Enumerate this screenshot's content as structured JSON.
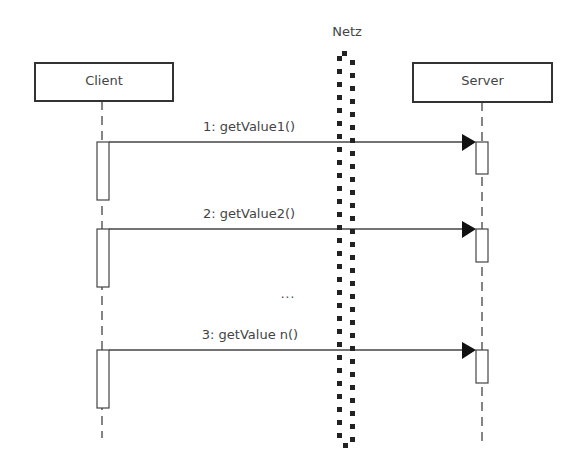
{
  "diagram": {
    "type": "sequence",
    "participants": [
      {
        "id": "client",
        "label": "Client"
      },
      {
        "id": "server",
        "label": "Server"
      }
    ],
    "boundary": {
      "label": "Netz"
    },
    "messages": [
      {
        "label": "1: getValue1()",
        "from": "client",
        "to": "server"
      },
      {
        "label": "2: getValue2()",
        "from": "client",
        "to": "server"
      },
      {
        "label": "3: getValue n()",
        "from": "client",
        "to": "server"
      }
    ],
    "ellipsis": "...",
    "colors": {
      "line": "#333333",
      "dots": "#222222",
      "background": "#ffffff"
    }
  }
}
